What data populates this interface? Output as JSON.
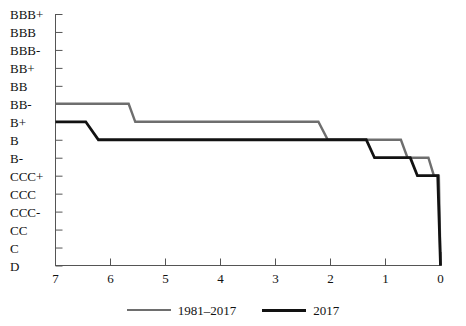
{
  "chart_data": {
    "type": "line",
    "title": "",
    "subtitle": "",
    "xlabel": "",
    "ylabel": "",
    "grid": false,
    "legend_position": "bottom",
    "x_ticks": [
      7,
      6,
      5,
      4,
      3,
      2,
      1,
      0
    ],
    "x_tick_labels": [
      "7",
      "6",
      "5",
      "4",
      "3",
      "2",
      "1",
      "0"
    ],
    "xlim": [
      7,
      0
    ],
    "x_axis_reversed": true,
    "y_categories": [
      "BBB+",
      "BBB",
      "BBB-",
      "BB+",
      "BB",
      "BB-",
      "B+",
      "B",
      "B-",
      "CCC+",
      "CCC",
      "CCC-",
      "CC",
      "C",
      "D"
    ],
    "ylim": [
      "BBB+",
      "D"
    ],
    "series": [
      {
        "name": "1981-2017",
        "color": "#6e6e6e",
        "style": "step",
        "points": [
          {
            "x": 7.0,
            "y": "BB-"
          },
          {
            "x": 5.67,
            "y": "BB-"
          },
          {
            "x": 5.55,
            "y": "B+"
          },
          {
            "x": 2.22,
            "y": "B+"
          },
          {
            "x": 2.05,
            "y": "B"
          },
          {
            "x": 0.72,
            "y": "B"
          },
          {
            "x": 0.6,
            "y": "B-"
          },
          {
            "x": 0.22,
            "y": "B-"
          },
          {
            "x": 0.12,
            "y": "CCC+"
          },
          {
            "x": 0.03,
            "y": "CCC+"
          },
          {
            "x": 0.0,
            "y": "D"
          }
        ]
      },
      {
        "name": "2017",
        "color": "#121212",
        "style": "step",
        "points": [
          {
            "x": 7.0,
            "y": "B+"
          },
          {
            "x": 6.45,
            "y": "B+"
          },
          {
            "x": 6.22,
            "y": "B"
          },
          {
            "x": 1.35,
            "y": "B"
          },
          {
            "x": 1.2,
            "y": "B-"
          },
          {
            "x": 0.55,
            "y": "B-"
          },
          {
            "x": 0.42,
            "y": "CCC+"
          },
          {
            "x": 0.05,
            "y": "CCC+"
          },
          {
            "x": 0.0,
            "y": "D"
          }
        ]
      }
    ],
    "legend": [
      {
        "label": "1981-2017",
        "color": "#6e6e6e"
      },
      {
        "label": "2017",
        "color": "#121212"
      }
    ]
  },
  "axes": {
    "y_labels": [
      {
        "text": "BBB+"
      },
      {
        "text": "BBB"
      },
      {
        "text": "BBB-"
      },
      {
        "text": "BB+"
      },
      {
        "text": "BB"
      },
      {
        "text": "BB-"
      },
      {
        "text": "B+"
      },
      {
        "text": "B"
      },
      {
        "text": "B-"
      },
      {
        "text": "CCC+"
      },
      {
        "text": "CCC"
      },
      {
        "text": "CCC-"
      },
      {
        "text": "CC"
      },
      {
        "text": "C"
      },
      {
        "text": "D"
      }
    ],
    "x_labels": [
      {
        "text": "7"
      },
      {
        "text": "6"
      },
      {
        "text": "5"
      },
      {
        "text": "4"
      },
      {
        "text": "3"
      },
      {
        "text": "2"
      },
      {
        "text": "1"
      },
      {
        "text": "0"
      }
    ]
  },
  "legend": {
    "series1_label": "1981–2017",
    "series2_label": "2017"
  },
  "colors": {
    "series1": "#6e6e6e",
    "series2": "#121212",
    "axis": "#555555",
    "background": "#ffffff"
  }
}
